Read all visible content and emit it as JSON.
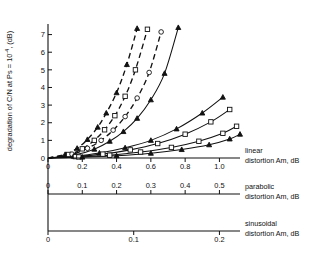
{
  "figure": {
    "y_axis_label": "degradation of C/N at Ps = 10",
    "y_axis_label_exp": "-4",
    "y_axis_label_tail": ", (dB)"
  },
  "axes": {
    "linear": {
      "name": "linear",
      "label_line1": "linear",
      "label_line2": "distortion Am, dB",
      "ticks": [
        "0",
        "0.2",
        "0.4",
        "0.6",
        "0.8",
        "1.0"
      ],
      "tick_values": [
        0,
        0.2,
        0.4,
        0.6,
        0.8,
        1.0
      ],
      "range": [
        0,
        1.12
      ]
    },
    "parabolic": {
      "name": "parabolic",
      "label_line1": "parabolic",
      "label_line2": "distortion Am, dB",
      "ticks": [
        "0",
        "0.1",
        "0.2",
        "0.3",
        "0.4",
        "0.5"
      ],
      "tick_values": [
        0,
        0.1,
        0.2,
        0.3,
        0.4,
        0.5
      ],
      "range": [
        0,
        0.56
      ]
    },
    "sinusoidal": {
      "name": "sinusoidal",
      "label_line1": "sinusoidal",
      "label_line2": "distortion Am, dB",
      "ticks": [
        "0",
        "0.1",
        "0.2"
      ],
      "tick_values": [
        0,
        0.1,
        0.2
      ],
      "range": [
        0,
        0.224
      ]
    },
    "y": {
      "ticks": [
        "0",
        "1",
        "2",
        "3",
        "4",
        "5",
        "6",
        "7"
      ],
      "tick_values": [
        0,
        1,
        2,
        3,
        4,
        5,
        6,
        7
      ],
      "range": [
        0,
        7.6
      ]
    }
  },
  "chart_data": {
    "type": "line",
    "title": "",
    "xlabel": "distortion Am, dB",
    "ylabel": "degradation of C/N at Ps = 10^-4, (dB)",
    "xlim": [
      0,
      1.12
    ],
    "ylim": [
      0,
      7.6
    ],
    "grid": false,
    "legend": "none",
    "x_axis_count": 3,
    "series": [
      {
        "name": "dashed-triangle",
        "style": "dashed",
        "marker": "triangle-filled",
        "x": [
          0.0,
          0.1,
          0.17,
          0.23,
          0.29,
          0.34,
          0.4,
          0.46,
          0.52
        ],
        "y": [
          0.0,
          0.2,
          0.55,
          1.05,
          1.75,
          2.55,
          3.7,
          5.3,
          7.35
        ]
      },
      {
        "name": "dashed-square",
        "style": "dashed",
        "marker": "square-open",
        "x": [
          0.0,
          0.12,
          0.2,
          0.27,
          0.33,
          0.39,
          0.45,
          0.51,
          0.58
        ],
        "y": [
          0.0,
          0.2,
          0.52,
          1.0,
          1.6,
          2.4,
          3.5,
          5.0,
          7.3
        ]
      },
      {
        "name": "dashed-circle",
        "style": "dashed",
        "marker": "circle-open",
        "x": [
          0.0,
          0.14,
          0.23,
          0.31,
          0.38,
          0.45,
          0.52,
          0.59,
          0.66
        ],
        "y": [
          0.0,
          0.22,
          0.55,
          1.0,
          1.58,
          2.35,
          3.4,
          4.85,
          7.15
        ]
      },
      {
        "name": "solid-triangle-steep",
        "style": "solid",
        "marker": "triangle-filled",
        "x": [
          0.0,
          0.16,
          0.27,
          0.36,
          0.44,
          0.52,
          0.6,
          0.68,
          0.76
        ],
        "y": [
          0.0,
          0.18,
          0.5,
          0.95,
          1.5,
          2.25,
          3.3,
          4.8,
          7.4
        ]
      },
      {
        "name": "solid-triangle-mid",
        "style": "solid",
        "marker": "triangle-filled",
        "x": [
          0.0,
          0.15,
          0.3,
          0.45,
          0.6,
          0.75,
          0.9,
          1.02
        ],
        "y": [
          0.0,
          0.1,
          0.28,
          0.58,
          1.0,
          1.65,
          2.55,
          3.45
        ]
      },
      {
        "name": "solid-square-mid",
        "style": "solid",
        "marker": "square-open",
        "x": [
          0.0,
          0.16,
          0.32,
          0.48,
          0.64,
          0.8,
          0.95,
          1.06
        ],
        "y": [
          0.0,
          0.08,
          0.22,
          0.46,
          0.82,
          1.35,
          2.05,
          2.75
        ]
      },
      {
        "name": "solid-square-low",
        "style": "solid",
        "marker": "square-open",
        "x": [
          0.0,
          0.18,
          0.36,
          0.54,
          0.72,
          0.88,
          1.02,
          1.1
        ],
        "y": [
          0.0,
          0.06,
          0.16,
          0.34,
          0.6,
          0.95,
          1.4,
          1.8
        ]
      },
      {
        "name": "solid-triangle-low",
        "style": "solid",
        "marker": "triangle-filled",
        "x": [
          0.0,
          0.2,
          0.4,
          0.6,
          0.78,
          0.94,
          1.06,
          1.12
        ],
        "y": [
          0.0,
          0.05,
          0.13,
          0.27,
          0.48,
          0.75,
          1.08,
          1.35
        ]
      }
    ]
  }
}
